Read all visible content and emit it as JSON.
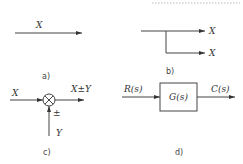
{
  "diagram": {
    "type": "block-diagram-elements",
    "panels": [
      {
        "id": "a",
        "caption": "a)",
        "description": "signal line",
        "labels": {
          "signal": "X"
        }
      },
      {
        "id": "b",
        "caption": "b)",
        "description": "branch point",
        "labels": {
          "out1": "X",
          "out2": "X"
        }
      },
      {
        "id": "c",
        "caption": "c)",
        "description": "summing junction",
        "labels": {
          "input": "X",
          "output": "X±Y",
          "sign": "±",
          "second_input": "Y"
        }
      },
      {
        "id": "d",
        "caption": "d)",
        "description": "transfer block",
        "labels": {
          "input": "R(s)",
          "block": "G(s)",
          "output": "C(s)"
        }
      }
    ],
    "colors": {
      "line": "#444444",
      "text": "#333333",
      "background": "#ffffff"
    }
  }
}
